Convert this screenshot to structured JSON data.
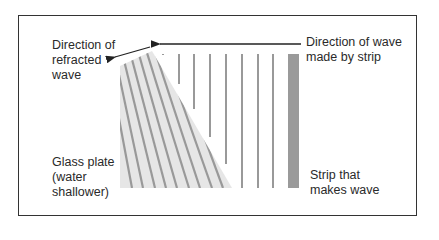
{
  "diagram": {
    "type": "wave-refraction-ripple-tank",
    "labels": {
      "refracted_direction": [
        "Direction of",
        "refracted",
        "wave"
      ],
      "wave_direction": [
        "Direction of wave",
        "made by strip"
      ],
      "glass_plate": [
        "Glass plate",
        "(water",
        "shallower)"
      ],
      "strip": [
        "Strip that",
        "makes wave"
      ]
    },
    "colors": {
      "frame": "#333333",
      "wave_line": "#999999",
      "strip": "#9a9a9a",
      "glass_plate": "#e6e6e6",
      "arrow": "#222222",
      "text": "#2a2a2a"
    },
    "vertical_wave_lines_x": [
      163,
      179,
      194,
      210,
      226,
      242,
      258,
      273
    ],
    "refracted_wave_lines": [
      {
        "x1": 122,
        "y1": 68,
        "x2": 126,
        "y2": 188
      },
      {
        "x1": 129,
        "y1": 64,
        "x2": 138,
        "y2": 188
      },
      {
        "x1": 136,
        "y1": 61,
        "x2": 150,
        "y2": 188
      },
      {
        "x1": 143,
        "y1": 58,
        "x2": 162,
        "y2": 188
      },
      {
        "x1": 150,
        "y1": 55,
        "x2": 174,
        "y2": 188
      },
      {
        "x1": 157,
        "y1": 53,
        "x2": 186,
        "y2": 188
      },
      {
        "x1": 163,
        "y1": 55,
        "x2": 198,
        "y2": 188
      },
      {
        "x1": 163,
        "y1": 80,
        "x2": 210,
        "y2": 188
      },
      {
        "x1": 163,
        "y1": 108,
        "x2": 222,
        "y2": 188
      }
    ]
  }
}
